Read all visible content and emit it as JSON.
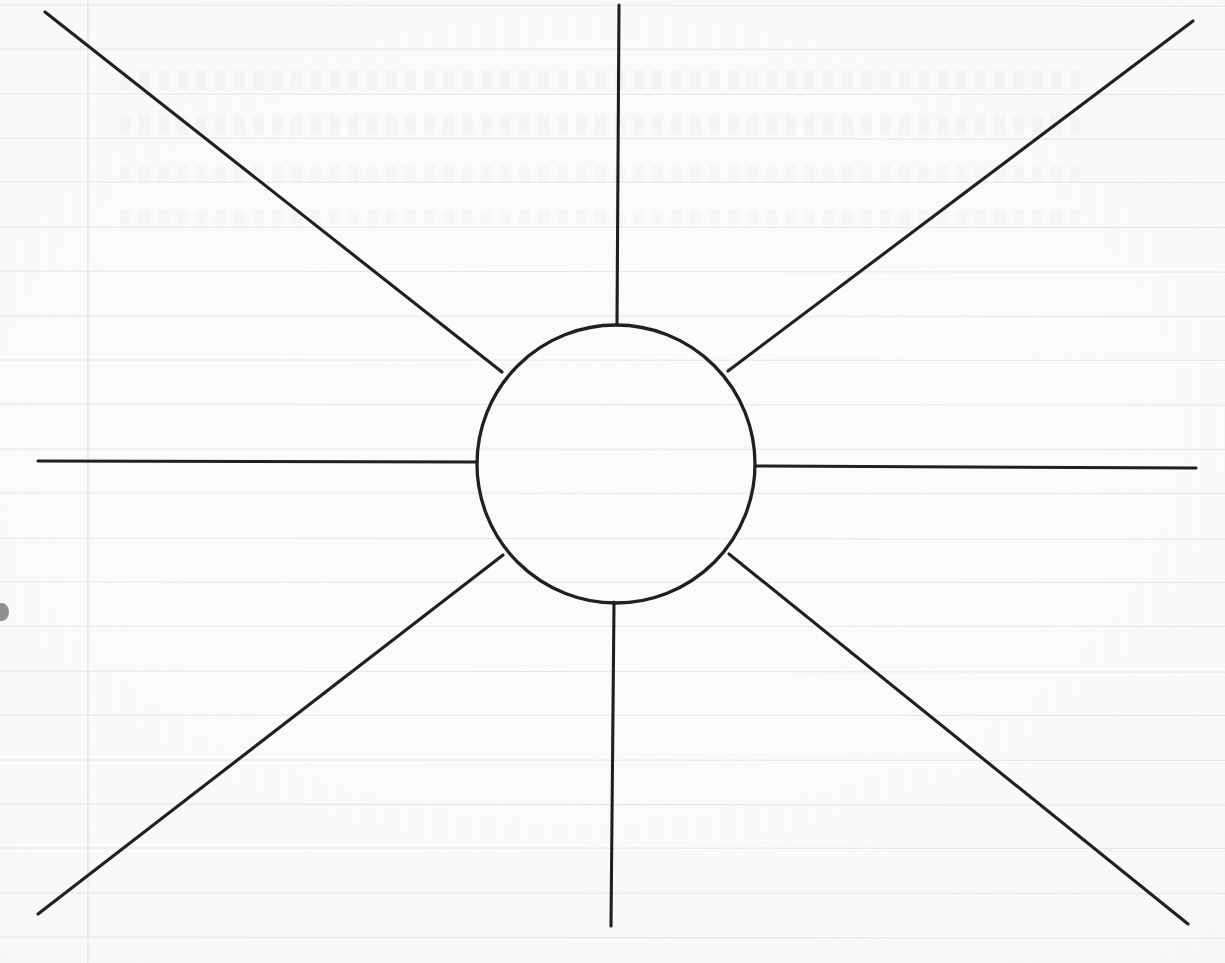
{
  "document": {
    "kind": "hand-drawn-diagram",
    "medium": "ballpoint pen on ruled notebook paper",
    "title": "Radial spoke diagram (empty sun / spider map)",
    "caption": "Blank hand-drawn radial diagram: one central circle with eight straight rays reaching the edges of the page. No labels or text written on the drawing.",
    "background_color": "#fbfbfa",
    "ink_color": "#221f22",
    "rule_color": "#cfd6de",
    "margin_color": "#d3d8de"
  },
  "canvas": {
    "width": 1225,
    "height": 963
  },
  "paper": {
    "ruled_line_spacing": 44.5,
    "ruled_line_y": [
      5,
      49,
      94,
      138,
      182,
      227,
      271,
      316,
      360,
      404,
      449,
      493,
      538,
      582,
      626,
      671,
      715,
      760,
      804,
      848,
      893,
      937
    ],
    "margin_rule_x": 88,
    "has_bleed_through": true,
    "edge_blot": {
      "x": 2,
      "y": 612,
      "rx": 7,
      "ry": 9
    }
  },
  "chart_data": {
    "type": "diagram",
    "subtype": "radial-spoke",
    "hub": {
      "label": "",
      "center_x": 616,
      "center_y": 464,
      "radius": 139,
      "stroke_width": 3.3
    },
    "ray_count": 8,
    "rays": [
      {
        "name": "ray-north",
        "angle_deg": 270,
        "inner_x": 617,
        "inner_y": 325,
        "outer_x": 619,
        "outer_y": 5,
        "stroke_width": 3.1
      },
      {
        "name": "ray-northeast",
        "angle_deg": 317,
        "inner_x": 728,
        "inner_y": 371,
        "outer_x": 1193,
        "outer_y": 21,
        "stroke_width": 3.1
      },
      {
        "name": "ray-east",
        "angle_deg": 0,
        "inner_x": 755,
        "inner_y": 466,
        "outer_x": 1196,
        "outer_y": 468,
        "stroke_width": 3.1
      },
      {
        "name": "ray-southeast",
        "angle_deg": 43,
        "inner_x": 729,
        "inner_y": 554,
        "outer_x": 1188,
        "outer_y": 924,
        "stroke_width": 3.1
      },
      {
        "name": "ray-south",
        "angle_deg": 90,
        "inner_x": 614,
        "inner_y": 602,
        "outer_x": 611,
        "outer_y": 926,
        "stroke_width": 3.1
      },
      {
        "name": "ray-southwest",
        "angle_deg": 137,
        "inner_x": 503,
        "inner_y": 555,
        "outer_x": 38,
        "outer_y": 914,
        "stroke_width": 3.1
      },
      {
        "name": "ray-west",
        "angle_deg": 180,
        "inner_x": 477,
        "inner_y": 462,
        "outer_x": 38,
        "outer_y": 461,
        "stroke_width": 3.1
      },
      {
        "name": "ray-northwest",
        "angle_deg": 223,
        "inner_x": 502,
        "inner_y": 372,
        "outer_x": 45,
        "outer_y": 12,
        "stroke_width": 3.1
      }
    ],
    "annotations": [],
    "legend": [],
    "grid": "ruled-paper-horizontal-plus-left-margin"
  }
}
